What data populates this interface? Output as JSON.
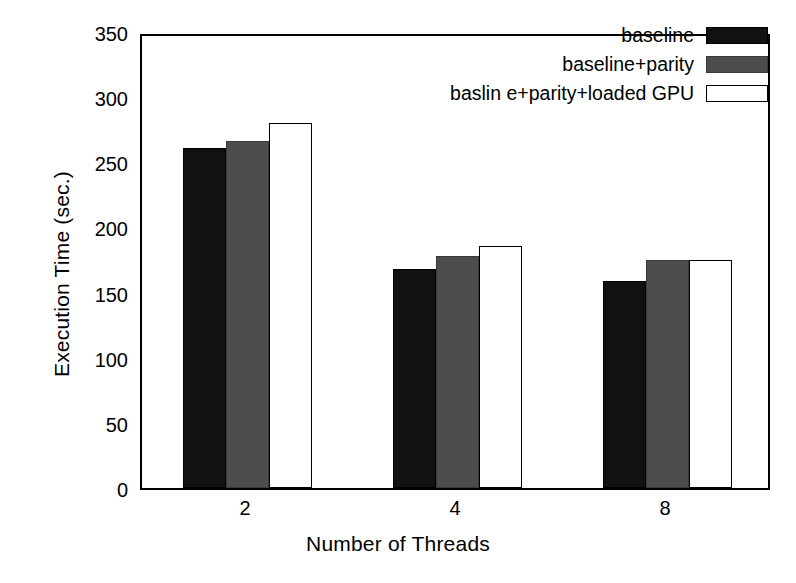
{
  "chart_data": {
    "type": "bar",
    "title": "",
    "xlabel": "Number of Threads",
    "ylabel": "Execution Time (sec.)",
    "categories": [
      "2",
      "4",
      "8"
    ],
    "series": [
      {
        "name": "baseline",
        "values": [
          261,
          168,
          159
        ],
        "color": "#111111"
      },
      {
        "name": "baseline+parity",
        "values": [
          266,
          178,
          175
        ],
        "color": "#4d4d4d"
      },
      {
        "name": "baslin e+parity+loaded GPU",
        "values": [
          280,
          186,
          175
        ],
        "color": "#ffffff"
      }
    ],
    "ylim": [
      0,
      350
    ],
    "yticks": [
      0,
      50,
      100,
      150,
      200,
      250,
      300,
      350
    ],
    "ytick_labels": [
      "0",
      "50",
      "100",
      "150",
      "200",
      "250",
      "300",
      "350"
    ],
    "grid": false,
    "legend_position": "top-right"
  }
}
